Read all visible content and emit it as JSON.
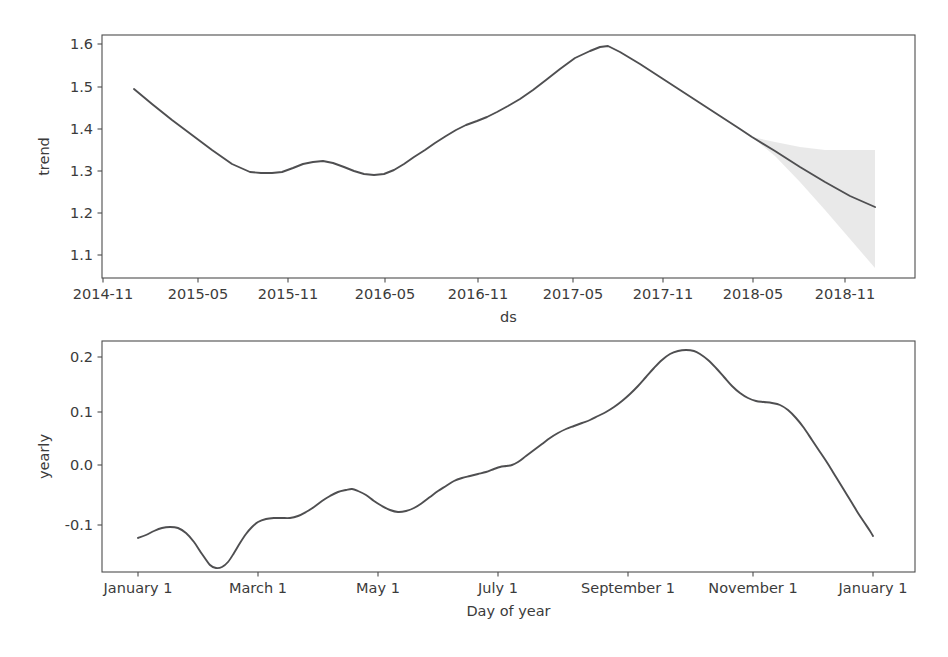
{
  "figure": {
    "width": 948,
    "height": 657,
    "background": "#ffffff",
    "line_color": "#4f4f51",
    "band_color": "#d7d7d7",
    "axis_color": "#4d4d4d",
    "text_color": "#3b3b3b"
  },
  "chart_data": [
    {
      "type": "line",
      "name": "trend-panel",
      "title": "",
      "xlabel": "ds",
      "ylabel": "trend",
      "grid": false,
      "legend": "none",
      "panel": {
        "x": 102,
        "y": 35,
        "width": 813,
        "height": 243
      },
      "xaxis": {
        "type": "date",
        "tick_labels": [
          "2014-11",
          "2015-05",
          "2015-11",
          "2016-05",
          "2016-11",
          "2017-05",
          "2017-11",
          "2018-05",
          "2018-11"
        ],
        "tick_px": [
          103,
          198,
          288,
          385,
          478,
          573,
          663,
          753,
          845
        ],
        "xlim_px": [
          102,
          915
        ]
      },
      "yaxis": {
        "tick_labels": [
          "1.1",
          "1.2",
          "1.3",
          "1.4",
          "1.5",
          "1.6"
        ],
        "tick_values": [
          1.1,
          1.2,
          1.3,
          1.4,
          1.5,
          1.6
        ],
        "tick_px": [
          255,
          213,
          171,
          129,
          87,
          44
        ],
        "ylim": [
          1.055,
          1.625
        ]
      },
      "series": [
        {
          "name": "trend",
          "points_px": [
            [
              134,
              89
            ],
            [
              152,
              104
            ],
            [
              172,
              120
            ],
            [
              192,
              135
            ],
            [
              212,
              150
            ],
            [
              232,
              164
            ],
            [
              250,
              172
            ],
            [
              261,
              173
            ],
            [
              272,
              173
            ],
            [
              282,
              172
            ],
            [
              293,
              168
            ],
            [
              303,
              164
            ],
            [
              313,
              162
            ],
            [
              323,
              161
            ],
            [
              333,
              163
            ],
            [
              344,
              167
            ],
            [
              354,
              171
            ],
            [
              364,
              174
            ],
            [
              374,
              175
            ],
            [
              384,
              174
            ],
            [
              394,
              170
            ],
            [
              404,
              164
            ],
            [
              414,
              157
            ],
            [
              425,
              150
            ],
            [
              435,
              143
            ],
            [
              446,
              136
            ],
            [
              456,
              130
            ],
            [
              466,
              125
            ],
            [
              477,
              121
            ],
            [
              487,
              117
            ],
            [
              497,
              112
            ],
            [
              508,
              106
            ],
            [
              520,
              99
            ],
            [
              533,
              90
            ],
            [
              546,
              80
            ],
            [
              560,
              69
            ],
            [
              575,
              58
            ],
            [
              590,
              51
            ],
            [
              600,
              47
            ],
            [
              608,
              46
            ],
            [
              620,
              52
            ],
            [
              640,
              64
            ],
            [
              660,
              77
            ],
            [
              680,
              90
            ],
            [
              700,
              103
            ],
            [
              720,
              116
            ],
            [
              740,
              129
            ],
            [
              752,
              137
            ],
            [
              775,
              151
            ],
            [
              800,
              167
            ],
            [
              825,
              182
            ],
            [
              850,
              196
            ],
            [
              875,
              207
            ]
          ]
        }
      ],
      "uncertainty": {
        "name": "trend-uncertainty",
        "upper_px": [
          [
            752,
            137
          ],
          [
            775,
            142
          ],
          [
            800,
            147
          ],
          [
            825,
            150
          ],
          [
            850,
            150
          ],
          [
            875,
            150
          ]
        ],
        "lower_px": [
          [
            752,
            137
          ],
          [
            775,
            156
          ],
          [
            800,
            182
          ],
          [
            825,
            210
          ],
          [
            850,
            239
          ],
          [
            875,
            268
          ]
        ]
      }
    },
    {
      "type": "line",
      "name": "yearly-panel",
      "title": "",
      "xlabel": "Day of year",
      "ylabel": "yearly",
      "grid": false,
      "legend": "none",
      "panel": {
        "x": 102,
        "y": 341,
        "width": 813,
        "height": 231
      },
      "xaxis": {
        "type": "day-of-year",
        "tick_labels": [
          "January 1",
          "March 1",
          "May 1",
          "July 1",
          "September 1",
          "November 1",
          "January 1"
        ],
        "tick_px": [
          138,
          258,
          378,
          498,
          628,
          753,
          873
        ],
        "xlim_px": [
          102,
          915
        ]
      },
      "yaxis": {
        "tick_labels": [
          "-0.1",
          "0.0",
          "0.1",
          "0.2"
        ],
        "tick_values": [
          -0.1,
          0.0,
          0.1,
          0.2
        ],
        "tick_px": [
          525,
          465,
          412,
          357
        ],
        "ylim": [
          -0.195,
          0.235
        ]
      },
      "series": [
        {
          "name": "yearly",
          "points_px": [
            [
              138,
              538
            ],
            [
              146,
              535
            ],
            [
              154,
              531
            ],
            [
              162,
              528
            ],
            [
              170,
              527
            ],
            [
              178,
              528
            ],
            [
              186,
              533
            ],
            [
              194,
              542
            ],
            [
              202,
              554
            ],
            [
              210,
              565
            ],
            [
              216,
              568
            ],
            [
              222,
              567
            ],
            [
              228,
              562
            ],
            [
              234,
              553
            ],
            [
              240,
              543
            ],
            [
              246,
              534
            ],
            [
              252,
              527
            ],
            [
              258,
              522
            ],
            [
              266,
              519
            ],
            [
              274,
              518
            ],
            [
              282,
              518
            ],
            [
              290,
              518
            ],
            [
              298,
              516
            ],
            [
              306,
              512
            ],
            [
              314,
              507
            ],
            [
              322,
              501
            ],
            [
              330,
              496
            ],
            [
              338,
              492
            ],
            [
              346,
              490
            ],
            [
              352,
              489
            ],
            [
              358,
              491
            ],
            [
              366,
              495
            ],
            [
              374,
              501
            ],
            [
              382,
              506
            ],
            [
              390,
              510
            ],
            [
              398,
              512
            ],
            [
              406,
              511
            ],
            [
              414,
              508
            ],
            [
              422,
              503
            ],
            [
              430,
              497
            ],
            [
              438,
              491
            ],
            [
              446,
              486
            ],
            [
              454,
              481
            ],
            [
              462,
              478
            ],
            [
              470,
              476
            ],
            [
              478,
              474
            ],
            [
              486,
              472
            ],
            [
              494,
              469
            ],
            [
              500,
              467
            ],
            [
              506,
              466
            ],
            [
              512,
              465
            ],
            [
              518,
              462
            ],
            [
              526,
              456
            ],
            [
              534,
              450
            ],
            [
              542,
              444
            ],
            [
              550,
              438
            ],
            [
              558,
              433
            ],
            [
              566,
              429
            ],
            [
              574,
              426
            ],
            [
              582,
              423
            ],
            [
              590,
              420
            ],
            [
              598,
              416
            ],
            [
              606,
              412
            ],
            [
              614,
              407
            ],
            [
              622,
              401
            ],
            [
              630,
              394
            ],
            [
              638,
              386
            ],
            [
              646,
              377
            ],
            [
              654,
              368
            ],
            [
              662,
              360
            ],
            [
              670,
              354
            ],
            [
              678,
              351
            ],
            [
              686,
              350
            ],
            [
              694,
              351
            ],
            [
              700,
              354
            ],
            [
              708,
              360
            ],
            [
              716,
              368
            ],
            [
              724,
              377
            ],
            [
              732,
              386
            ],
            [
              740,
              393
            ],
            [
              748,
              398
            ],
            [
              756,
              401
            ],
            [
              764,
              402
            ],
            [
              772,
              403
            ],
            [
              780,
              405
            ],
            [
              788,
              410
            ],
            [
              796,
              418
            ],
            [
              804,
              428
            ],
            [
              812,
              440
            ],
            [
              820,
              452
            ],
            [
              828,
              464
            ],
            [
              836,
              477
            ],
            [
              844,
              490
            ],
            [
              852,
              503
            ],
            [
              858,
              513
            ],
            [
              864,
              522
            ],
            [
              870,
              531
            ],
            [
              873,
              536
            ]
          ]
        }
      ]
    }
  ]
}
